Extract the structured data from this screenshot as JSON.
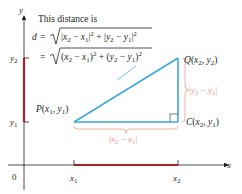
{
  "figure": {
    "caption_line": "This distance is",
    "formula_line1": {
      "lhs": "d",
      "eq": "=",
      "radicand": "|x2 − x1|² + |y2 − y1|²"
    },
    "formula_line2": {
      "eq": "=",
      "radicand": "(x2 − x1)² + (y2 − y1)²"
    }
  },
  "axes": {
    "x_label": "x",
    "y_label": "y",
    "origin_label": "0",
    "x_ticks": [
      "x1",
      "x2"
    ],
    "y_ticks": [
      "y2",
      "y1"
    ]
  },
  "points": {
    "P": {
      "name": "P",
      "coords": "(x1, y1)"
    },
    "Q": {
      "name": "Q",
      "coords": "(x2, y2)"
    },
    "C": {
      "name": "C",
      "coords": "(x2, y1)"
    }
  },
  "braces": {
    "horizontal": "|x2 − x1|",
    "vertical": "|y2 − y1|"
  },
  "colors": {
    "triangle": "#3aa8dc",
    "segment": "#a6232b",
    "brace": "#e8a090",
    "axis": "#231f20"
  }
}
